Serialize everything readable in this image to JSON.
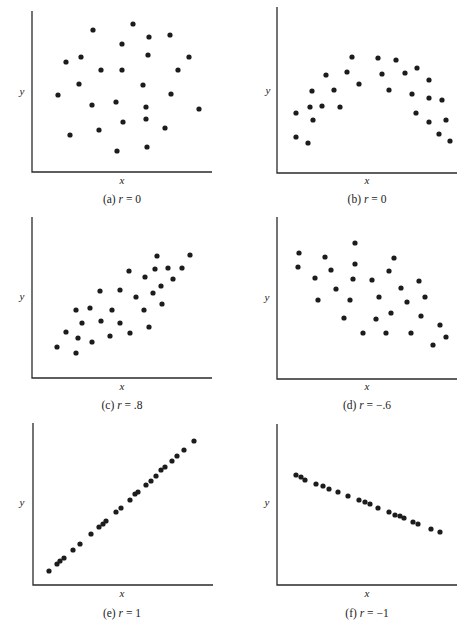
{
  "figure": {
    "dot_color": "#1c1c1c",
    "axis_color": "#2a2a2a"
  },
  "chart_data": [
    {
      "type": "scatter",
      "id": "a",
      "title": "(a) r = 0",
      "caption_prefix": "(a) ",
      "caption_r": "r",
      "caption_value": " = 0",
      "xlabel": "x",
      "ylabel": "y",
      "frame": {
        "x0": 32,
        "yTop": 11,
        "yBase": 172,
        "x1": 212
      },
      "labels": {
        "y": [
          22,
          95
        ],
        "x": [
          122,
          184
        ],
        "caption": [
          122,
          203
        ]
      },
      "points_px": [
        [
          93,
          30
        ],
        [
          133,
          24
        ],
        [
          149,
          37
        ],
        [
          170,
          35
        ],
        [
          122,
          44
        ],
        [
          66,
          62
        ],
        [
          81,
          57
        ],
        [
          148,
          55
        ],
        [
          189,
          57
        ],
        [
          101,
          70
        ],
        [
          122,
          70
        ],
        [
          178,
          70
        ],
        [
          79,
          84
        ],
        [
          143,
          85
        ],
        [
          58,
          95
        ],
        [
          171,
          94
        ],
        [
          92,
          105
        ],
        [
          116,
          102
        ],
        [
          146,
          107
        ],
        [
          199,
          109
        ],
        [
          146,
          119
        ],
        [
          123,
          122
        ],
        [
          70,
          135
        ],
        [
          99,
          130
        ],
        [
          165,
          128
        ],
        [
          117,
          151
        ],
        [
          147,
          147
        ]
      ]
    },
    {
      "type": "scatter",
      "id": "b",
      "title": "(b) r = 0",
      "caption_prefix": "(b) ",
      "caption_r": "r",
      "caption_value": " = 0",
      "xlabel": "x",
      "ylabel": "y",
      "frame": {
        "x0": 277,
        "yTop": 7,
        "yBase": 173,
        "x1": 457
      },
      "labels": {
        "y": [
          268,
          94
        ],
        "x": [
          367,
          184
        ],
        "caption": [
          367,
          203
        ]
      },
      "points_px": [
        [
          296,
          113
        ],
        [
          296,
          137
        ],
        [
          308,
          143
        ],
        [
          312,
          91
        ],
        [
          310,
          107
        ],
        [
          313,
          120
        ],
        [
          322,
          106
        ],
        [
          326,
          75
        ],
        [
          334,
          90
        ],
        [
          340,
          107
        ],
        [
          347,
          72
        ],
        [
          352,
          57
        ],
        [
          359,
          84
        ],
        [
          378,
          58
        ],
        [
          382,
          74
        ],
        [
          389,
          90
        ],
        [
          396,
          60
        ],
        [
          405,
          73
        ],
        [
          412,
          94
        ],
        [
          417,
          68
        ],
        [
          416,
          113
        ],
        [
          429,
          80
        ],
        [
          429,
          98
        ],
        [
          429,
          122
        ],
        [
          442,
          100
        ],
        [
          446,
          120
        ],
        [
          439,
          134
        ],
        [
          450,
          141
        ]
      ]
    },
    {
      "type": "scatter",
      "id": "c",
      "title": "(c) r = .8",
      "caption_prefix": "(c) ",
      "caption_r": "r",
      "caption_value": " = .8",
      "xlabel": "x",
      "ylabel": "y",
      "frame": {
        "x0": 32,
        "yTop": 217,
        "yBase": 378,
        "x1": 212
      },
      "labels": {
        "y": [
          22,
          300
        ],
        "x": [
          122,
          390
        ],
        "caption": [
          122,
          409
        ]
      },
      "points_px": [
        [
          57,
          347
        ],
        [
          76,
          353
        ],
        [
          66,
          332
        ],
        [
          78,
          338
        ],
        [
          92,
          342
        ],
        [
          76,
          310
        ],
        [
          82,
          323
        ],
        [
          90,
          308
        ],
        [
          101,
          321
        ],
        [
          100,
          291
        ],
        [
          110,
          336
        ],
        [
          112,
          310
        ],
        [
          120,
          290
        ],
        [
          120,
          323
        ],
        [
          130,
          333
        ],
        [
          129,
          271
        ],
        [
          136,
          297
        ],
        [
          144,
          310
        ],
        [
          145,
          277
        ],
        [
          149,
          327
        ],
        [
          153,
          293
        ],
        [
          155,
          269
        ],
        [
          157,
          256
        ],
        [
          161,
          286
        ],
        [
          162,
          304
        ],
        [
          168,
          268
        ],
        [
          173,
          279
        ],
        [
          182,
          268
        ],
        [
          190,
          255
        ]
      ]
    },
    {
      "type": "scatter",
      "id": "d",
      "title": "(d) r = −.6",
      "caption_prefix": "(d) ",
      "caption_r": "r",
      "caption_value": " = −.6",
      "xlabel": "x",
      "ylabel": "y",
      "frame": {
        "x0": 277,
        "yTop": 217,
        "yBase": 379,
        "x1": 457
      },
      "labels": {
        "y": [
          267,
          301
        ],
        "x": [
          367,
          390
        ],
        "caption": [
          367,
          409
        ]
      },
      "points_px": [
        [
          299,
          253
        ],
        [
          298,
          267
        ],
        [
          315,
          278
        ],
        [
          318,
          300
        ],
        [
          325,
          257
        ],
        [
          331,
          270
        ],
        [
          336,
          289
        ],
        [
          344,
          318
        ],
        [
          350,
          300
        ],
        [
          353,
          279
        ],
        [
          355,
          264
        ],
        [
          355,
          243
        ],
        [
          363,
          333
        ],
        [
          372,
          280
        ],
        [
          376,
          319
        ],
        [
          379,
          297
        ],
        [
          386,
          333
        ],
        [
          389,
          271
        ],
        [
          391,
          313
        ],
        [
          394,
          258
        ],
        [
          401,
          288
        ],
        [
          407,
          302
        ],
        [
          411,
          333
        ],
        [
          419,
          281
        ],
        [
          421,
          316
        ],
        [
          425,
          297
        ],
        [
          433,
          345
        ],
        [
          440,
          325
        ],
        [
          446,
          337
        ]
      ]
    },
    {
      "type": "scatter",
      "id": "e",
      "title": "(e) r = 1",
      "caption_prefix": "(e) ",
      "caption_r": "r",
      "caption_value": " = 1",
      "xlabel": "x",
      "ylabel": "y",
      "frame": {
        "x0": 33,
        "yTop": 423,
        "yBase": 585,
        "x1": 213
      },
      "labels": {
        "y": [
          22,
          506
        ],
        "x": [
          122,
          597
        ],
        "caption": [
          122,
          617
        ]
      },
      "points_px": [
        [
          49,
          571
        ],
        [
          57,
          564
        ],
        [
          60,
          561
        ],
        [
          64,
          558
        ],
        [
          73,
          550
        ],
        [
          80,
          544
        ],
        [
          91,
          534
        ],
        [
          99,
          527
        ],
        [
          103,
          524
        ],
        [
          106,
          521
        ],
        [
          116,
          512
        ],
        [
          121,
          508
        ],
        [
          130,
          500
        ],
        [
          135,
          494
        ],
        [
          138,
          492
        ],
        [
          146,
          485
        ],
        [
          151,
          481
        ],
        [
          156,
          476
        ],
        [
          161,
          470
        ],
        [
          165,
          467
        ],
        [
          172,
          461
        ],
        [
          177,
          456
        ],
        [
          184,
          450
        ],
        [
          194,
          441
        ]
      ]
    },
    {
      "type": "scatter",
      "id": "f",
      "title": "(f) r = −1",
      "caption_prefix": "(f) ",
      "caption_r": "r",
      "caption_value": " = −1",
      "xlabel": "x",
      "ylabel": "y",
      "frame": {
        "x0": 277,
        "yTop": 424,
        "yBase": 585,
        "x1": 457
      },
      "labels": {
        "y": [
          267,
          506
        ],
        "x": [
          367,
          597
        ],
        "caption": [
          367,
          617
        ]
      },
      "points_px": [
        [
          296,
          475
        ],
        [
          301,
          477
        ],
        [
          305,
          480
        ],
        [
          316,
          484
        ],
        [
          323,
          486
        ],
        [
          329,
          489
        ],
        [
          338,
          492
        ],
        [
          348,
          496
        ],
        [
          359,
          500
        ],
        [
          365,
          502
        ],
        [
          370,
          504
        ],
        [
          378,
          508
        ],
        [
          389,
          512
        ],
        [
          395,
          515
        ],
        [
          400,
          516
        ],
        [
          404,
          518
        ],
        [
          413,
          522
        ],
        [
          418,
          524
        ],
        [
          431,
          529
        ],
        [
          440,
          532
        ]
      ]
    }
  ]
}
